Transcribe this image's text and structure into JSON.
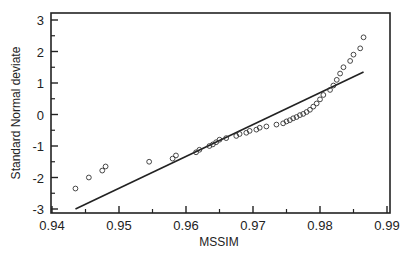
{
  "chart_data": {
    "type": "scatter",
    "title": "",
    "xlabel": "MSSIM",
    "ylabel": "Standard Normal deviate",
    "xlim": [
      0.94,
      0.99
    ],
    "ylim": [
      -3,
      3
    ],
    "x_ticks": [
      "0.94",
      "0.95",
      "0.96",
      "0.97",
      "0.98",
      "0.99"
    ],
    "y_ticks": [
      "-3",
      "-2",
      "-1",
      "0",
      "1",
      "2",
      "3"
    ],
    "grid": false,
    "legend": null,
    "series": [
      {
        "name": "observations",
        "marker": "open-circle",
        "points": [
          [
            0.9435,
            -2.35
          ],
          [
            0.9455,
            -2.0
          ],
          [
            0.9475,
            -1.78
          ],
          [
            0.948,
            -1.65
          ],
          [
            0.9545,
            -1.5
          ],
          [
            0.958,
            -1.4
          ],
          [
            0.9585,
            -1.3
          ],
          [
            0.9615,
            -1.2
          ],
          [
            0.962,
            -1.12
          ],
          [
            0.9635,
            -1.0
          ],
          [
            0.964,
            -0.95
          ],
          [
            0.9645,
            -0.88
          ],
          [
            0.965,
            -0.8
          ],
          [
            0.966,
            -0.75
          ],
          [
            0.9675,
            -0.68
          ],
          [
            0.968,
            -0.62
          ],
          [
            0.969,
            -0.58
          ],
          [
            0.9695,
            -0.52
          ],
          [
            0.9705,
            -0.48
          ],
          [
            0.971,
            -0.42
          ],
          [
            0.972,
            -0.38
          ],
          [
            0.9735,
            -0.32
          ],
          [
            0.9745,
            -0.28
          ],
          [
            0.975,
            -0.22
          ],
          [
            0.9755,
            -0.18
          ],
          [
            0.976,
            -0.12
          ],
          [
            0.9765,
            -0.08
          ],
          [
            0.977,
            -0.02
          ],
          [
            0.9775,
            0.02
          ],
          [
            0.978,
            0.08
          ],
          [
            0.9785,
            0.15
          ],
          [
            0.979,
            0.25
          ],
          [
            0.9795,
            0.35
          ],
          [
            0.98,
            0.48
          ],
          [
            0.9805,
            0.62
          ],
          [
            0.9815,
            0.78
          ],
          [
            0.982,
            0.92
          ],
          [
            0.9825,
            1.1
          ],
          [
            0.983,
            1.3
          ],
          [
            0.9835,
            1.5
          ],
          [
            0.9845,
            1.7
          ],
          [
            0.985,
            1.9
          ],
          [
            0.986,
            2.1
          ],
          [
            0.9865,
            2.45
          ]
        ]
      },
      {
        "name": "fitted line",
        "marker": "line",
        "points": [
          [
            0.9435,
            -3.0
          ],
          [
            0.9865,
            1.35
          ]
        ]
      }
    ]
  }
}
